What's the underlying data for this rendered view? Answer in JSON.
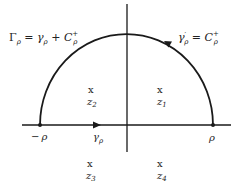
{
  "diagram": {
    "title_label": {
      "main": "Γ",
      "sub": "ρ",
      "eq": " = ",
      "g": "γ",
      "gsub": "ρ",
      "plus": " + ",
      "C": "C",
      "Csup": "+",
      "Csub": "ρ"
    },
    "arc_label": {
      "g": "γ",
      "gprime": "′",
      "gsub": "ρ",
      "eq": " = ",
      "C": "C",
      "Csup": "+",
      "Csub": "ρ"
    },
    "axis_labels": {
      "left_minus": "−",
      "left_rho": "ρ",
      "right_rho": "ρ",
      "gamma": "γ",
      "gamma_sub": "ρ"
    },
    "points": [
      {
        "mark": "x",
        "name": "z",
        "sub": "1",
        "x": 161,
        "y": 89
      },
      {
        "mark": "x",
        "name": "z",
        "sub": "2",
        "x": 92,
        "y": 89
      },
      {
        "mark": "x",
        "name": "z",
        "sub": "3",
        "x": 91,
        "y": 163
      },
      {
        "mark": "x",
        "name": "z",
        "sub": "4",
        "x": 161,
        "y": 163
      }
    ],
    "colors": {
      "stroke": "#1a1a1a",
      "background": "#ffffff"
    }
  }
}
